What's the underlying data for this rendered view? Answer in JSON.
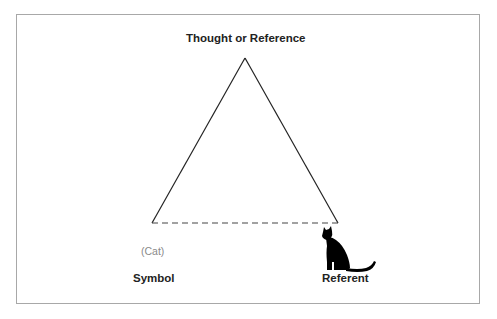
{
  "diagram": {
    "apex_label": "Thought or Reference",
    "left_label": "Symbol",
    "left_example": "(Cat)",
    "right_label": "Referent",
    "right_icon": "cat-silhouette-icon",
    "edges": [
      {
        "from": "Thought or Reference",
        "to": "Symbol",
        "style": "solid"
      },
      {
        "from": "Thought or Reference",
        "to": "Referent",
        "style": "solid"
      },
      {
        "from": "Symbol",
        "to": "Referent",
        "style": "dashed"
      }
    ],
    "colors": {
      "line": "#222222",
      "frame": "#a8a8a8",
      "example_text": "#8a8a8a"
    }
  }
}
